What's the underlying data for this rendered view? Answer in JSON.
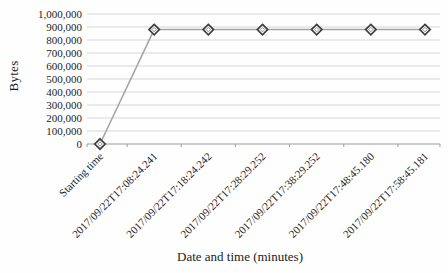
{
  "chart_data": {
    "type": "line",
    "title": "",
    "xlabel": "Date and time (minutes)",
    "ylabel": "Bytes",
    "categories": [
      "Starting time",
      "2017/09/22T17:08:24.241",
      "2017/09/22T17:18:24.242",
      "2017/09/22T17:28:29.252",
      "2017/09/22T17:38:29.252",
      "2017/09/22T17:48:45.180",
      "2017/09/22T17:58:45.181"
    ],
    "series": [
      {
        "name": "Bytes",
        "values": [
          0,
          880000,
          880000,
          880000,
          880000,
          880000,
          880000
        ]
      }
    ],
    "ylim": [
      0,
      1000000
    ],
    "y_tick_step": 100000,
    "y_tick_labels": [
      "0",
      "100,000",
      "200,000",
      "300,000",
      "400,000",
      "500,000",
      "600,000",
      "700,000",
      "800,000",
      "900,000",
      "1,000,000"
    ],
    "grid": true,
    "legend": "none",
    "marker": "diamond",
    "colors": {
      "line": "#a3a3a3",
      "marker_stroke": "#3d3d3d",
      "marker_inner": "#909090",
      "marker_fill": "#fdfdfd",
      "grid": "#d6d6d6",
      "axis": "#9c9c9c",
      "text": "#1c1c1c"
    }
  }
}
